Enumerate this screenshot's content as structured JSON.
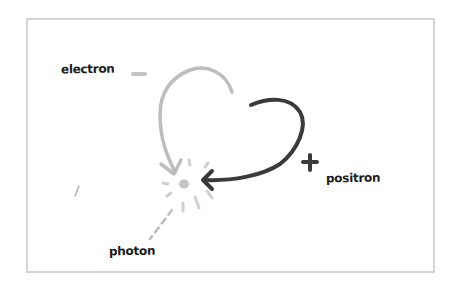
{
  "diagram": {
    "title": "",
    "labels": {
      "electron": "electron",
      "positron": "positron",
      "photon": "photon"
    },
    "symbols": {
      "electron_charge": "minus-sign",
      "positron_charge": "plus-sign"
    },
    "nodes": [
      {
        "id": "electron",
        "label": "electron",
        "charge": "-",
        "color": "#bdbdbd"
      },
      {
        "id": "positron",
        "label": "positron",
        "charge": "+",
        "color": "#3a3a3a"
      },
      {
        "id": "annihilation",
        "label": "",
        "type": "starburst",
        "color": "#c8c8c8"
      },
      {
        "id": "photon",
        "label": "photon",
        "type": "dashed-line",
        "color": "#bdbdbd"
      }
    ],
    "edges": [
      {
        "from": "electron",
        "to": "annihilation",
        "style": "curved-arrow",
        "color": "#bdbdbd"
      },
      {
        "from": "positron",
        "to": "annihilation",
        "style": "curved-arrow",
        "color": "#3a3a3a"
      },
      {
        "from": "annihilation",
        "to": "photon",
        "style": "dashed"
      }
    ],
    "colors": {
      "frame": "#d4d4d4",
      "electron_arrow": "#bdbdbd",
      "positron_arrow": "#3a3a3a",
      "text": "#1e1e1e"
    }
  }
}
